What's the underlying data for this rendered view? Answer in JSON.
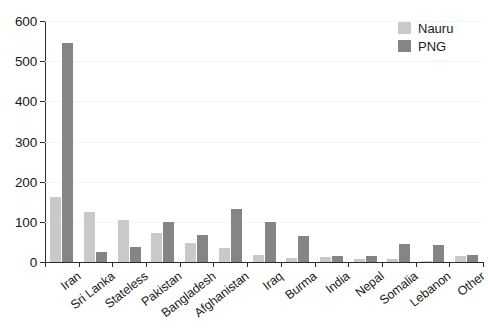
{
  "chart_data": {
    "type": "bar",
    "title": "",
    "subtitle": "",
    "xlabel": "",
    "ylabel": "",
    "ylim": [
      0,
      600
    ],
    "yticks": [
      0,
      100,
      200,
      300,
      400,
      500,
      600
    ],
    "ytick_labels": [
      "0",
      "100",
      "200",
      "300",
      "400",
      "500",
      "600"
    ],
    "grid": true,
    "legend_position": "top-right",
    "categories": [
      "Iran",
      "Sri Lanka",
      "Stateless",
      "Pakistan",
      "Bangladesh",
      "Afghanistan",
      "Iraq",
      "Burma",
      "India",
      "Nepal",
      "Somalia",
      "Lebanon",
      "Other"
    ],
    "series": [
      {
        "name": "Nauru",
        "color": "#c9c9c9",
        "values": [
          163,
          124,
          105,
          72,
          48,
          35,
          18,
          10,
          13,
          7,
          8,
          2,
          16
        ]
      },
      {
        "name": "PNG",
        "color": "#858585",
        "values": [
          546,
          26,
          38,
          100,
          68,
          133,
          100,
          65,
          14,
          14,
          45,
          43,
          18
        ]
      }
    ]
  },
  "legend": {
    "items": [
      {
        "label": "Nauru",
        "color": "#c9c9c9"
      },
      {
        "label": "PNG",
        "color": "#858585"
      }
    ]
  },
  "colors": {
    "nauru": "#c9c9c9",
    "png": "#858585",
    "axis": "#2b2b2b",
    "grid": "#f4f4f4",
    "text": "#1a1a1a",
    "background": "#ffffff"
  }
}
